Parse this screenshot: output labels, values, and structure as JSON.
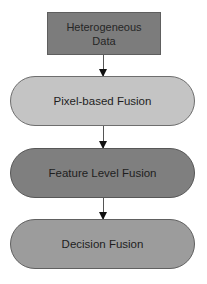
{
  "diagram": {
    "type": "flowchart",
    "nodes": [
      {
        "id": "input",
        "shape": "rectangle",
        "label_line1": "Heterogeneous",
        "label_line2": "Data",
        "fill": "#7c7c7c"
      },
      {
        "id": "pixel",
        "shape": "rounded-pill",
        "label": "Pixel-based Fusion",
        "fill": "#c4c4c4"
      },
      {
        "id": "feature",
        "shape": "rounded-pill",
        "label": "Feature Level Fusion",
        "fill": "#7f7f7f"
      },
      {
        "id": "decision",
        "shape": "rounded-pill",
        "label": "Decision Fusion",
        "fill": "#9c9c9c"
      }
    ],
    "edges": [
      {
        "from": "input",
        "to": "pixel"
      },
      {
        "from": "pixel",
        "to": "feature"
      },
      {
        "from": "feature",
        "to": "decision"
      }
    ]
  }
}
